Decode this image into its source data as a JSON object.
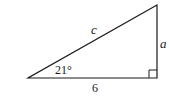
{
  "diagram": {
    "type": "right-triangle",
    "stroke_color": "#1a1a1a",
    "background": "#ffffff",
    "vertices": {
      "left": [
        28,
        78
      ],
      "right_bottom": [
        157,
        78
      ],
      "top": [
        157,
        5
      ]
    },
    "labels": {
      "hypotenuse": "c",
      "opposite_side": "a",
      "adjacent_side": "6",
      "angle": "21°"
    },
    "right_angle_marker": true
  }
}
